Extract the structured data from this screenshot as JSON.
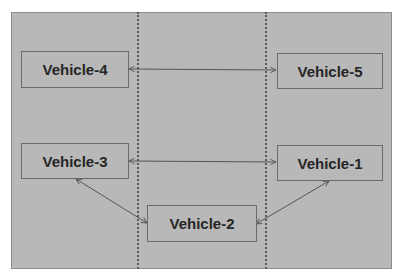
{
  "diagram": {
    "type": "network-topology",
    "background_color": "#b8b8b8",
    "nodes": [
      {
        "id": "vehicle-4",
        "label": "Vehicle-4"
      },
      {
        "id": "vehicle-5",
        "label": "Vehicle-5"
      },
      {
        "id": "vehicle-3",
        "label": "Vehicle-3"
      },
      {
        "id": "vehicle-1",
        "label": "Vehicle-1"
      },
      {
        "id": "vehicle-2",
        "label": "Vehicle-2"
      }
    ],
    "edges": [
      {
        "from": "vehicle-4",
        "to": "vehicle-5",
        "direction": "bidirectional"
      },
      {
        "from": "vehicle-3",
        "to": "vehicle-1",
        "direction": "bidirectional"
      },
      {
        "from": "vehicle-3",
        "to": "vehicle-2",
        "direction": "bidirectional"
      },
      {
        "from": "vehicle-1",
        "to": "vehicle-2",
        "direction": "bidirectional"
      }
    ],
    "lane_dividers": 2
  }
}
